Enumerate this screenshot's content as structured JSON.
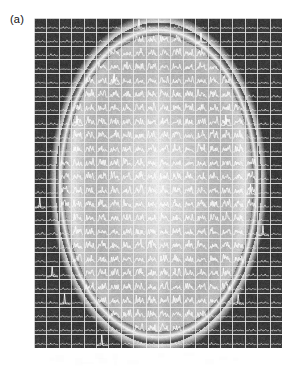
{
  "figure": {
    "panel_label": "(a)",
    "type": "mrsi-spectroscopic-imaging-overlay",
    "modality": "MR Spectroscopic Imaging (MRSI) grid overlaid on axial brain MRI",
    "colors": {
      "page_background": "#ffffff",
      "label_text": "#111111",
      "image_background_dark": "#3a3a3a",
      "skull_ring_bright": "#f2f2f2",
      "brain_interior": "#b9b9b9",
      "grid_line": "#e8e8e8",
      "spectrum_trace": "#fdfdfd",
      "footer_mark": "#f1f1f1"
    },
    "image_region": {
      "left_px": 34,
      "top_px": 18,
      "width_px": 248,
      "height_px": 330
    },
    "grid": {
      "columns": 20,
      "rows": 24,
      "cell_width_px": 12.4,
      "cell_height_px": 13.75,
      "line_width_px": 1,
      "visible": true
    },
    "brain": {
      "shape": "ellipse",
      "center_x_frac": 0.5,
      "center_y_frac": 0.5,
      "radius_x_frac": 0.395,
      "radius_y_frac": 0.465,
      "skull_ring_thickness_frac": 0.035,
      "interior_brightness": 0.72,
      "exterior_brightness": 0.23
    },
    "spectra": {
      "description": "Each voxel cell holds a small 1D NMR spectrum trace; amplitude and peak count are higher inside the brain parenchyma and minimal outside the skull.",
      "trace_color": "#fdfdfd",
      "baseline_frac": 0.78,
      "peak_count_inside": 5,
      "peak_count_outside": 2,
      "max_amplitude_inside_frac": 0.62,
      "max_amplitude_outside_frac": 0.16
    },
    "footer_marks": {
      "present": true,
      "count": 14,
      "opacity": 0.06,
      "description": "very faint light-gray residual marks beneath the image block"
    }
  },
  "chart_data": {
    "type": "heatmap",
    "title": "(a)",
    "xlabel": "",
    "ylabel": "",
    "grid": true,
    "legend": "none",
    "nx": 20,
    "ny": 24,
    "value_label": "MRI signal intensity (0-1)",
    "zlim": [
      0,
      1
    ],
    "row_intensity_profiles": [
      [
        0.22,
        0.22,
        0.23,
        0.23,
        0.24,
        0.26,
        0.3,
        0.36,
        0.42,
        0.46,
        0.46,
        0.42,
        0.36,
        0.3,
        0.26,
        0.24,
        0.23,
        0.23,
        0.22,
        0.22
      ],
      [
        0.22,
        0.23,
        0.23,
        0.24,
        0.28,
        0.4,
        0.62,
        0.8,
        0.9,
        0.93,
        0.93,
        0.9,
        0.8,
        0.62,
        0.4,
        0.28,
        0.24,
        0.23,
        0.23,
        0.22
      ],
      [
        0.23,
        0.23,
        0.24,
        0.3,
        0.52,
        0.82,
        0.92,
        0.8,
        0.74,
        0.72,
        0.72,
        0.74,
        0.8,
        0.92,
        0.82,
        0.52,
        0.3,
        0.24,
        0.23,
        0.23
      ],
      [
        0.23,
        0.24,
        0.28,
        0.46,
        0.8,
        0.9,
        0.74,
        0.7,
        0.7,
        0.7,
        0.7,
        0.7,
        0.7,
        0.74,
        0.9,
        0.8,
        0.46,
        0.28,
        0.24,
        0.23
      ],
      [
        0.24,
        0.25,
        0.34,
        0.66,
        0.88,
        0.76,
        0.7,
        0.7,
        0.71,
        0.72,
        0.72,
        0.71,
        0.7,
        0.7,
        0.76,
        0.88,
        0.66,
        0.34,
        0.25,
        0.24
      ],
      [
        0.24,
        0.26,
        0.42,
        0.8,
        0.82,
        0.71,
        0.7,
        0.71,
        0.73,
        0.75,
        0.75,
        0.73,
        0.71,
        0.7,
        0.71,
        0.82,
        0.8,
        0.42,
        0.26,
        0.24
      ],
      [
        0.25,
        0.28,
        0.52,
        0.86,
        0.76,
        0.7,
        0.71,
        0.73,
        0.76,
        0.78,
        0.78,
        0.76,
        0.73,
        0.71,
        0.7,
        0.76,
        0.86,
        0.52,
        0.28,
        0.25
      ],
      [
        0.25,
        0.3,
        0.58,
        0.88,
        0.73,
        0.7,
        0.72,
        0.75,
        0.78,
        0.8,
        0.8,
        0.78,
        0.75,
        0.72,
        0.7,
        0.73,
        0.88,
        0.58,
        0.3,
        0.25
      ],
      [
        0.26,
        0.31,
        0.6,
        0.88,
        0.72,
        0.7,
        0.73,
        0.77,
        0.8,
        0.82,
        0.82,
        0.8,
        0.77,
        0.73,
        0.7,
        0.72,
        0.88,
        0.6,
        0.31,
        0.26
      ],
      [
        0.26,
        0.32,
        0.62,
        0.88,
        0.72,
        0.71,
        0.74,
        0.78,
        0.82,
        0.84,
        0.84,
        0.82,
        0.78,
        0.74,
        0.71,
        0.72,
        0.88,
        0.62,
        0.32,
        0.26
      ],
      [
        0.26,
        0.32,
        0.62,
        0.88,
        0.72,
        0.71,
        0.75,
        0.79,
        0.83,
        0.85,
        0.85,
        0.83,
        0.79,
        0.75,
        0.71,
        0.72,
        0.88,
        0.62,
        0.32,
        0.26
      ],
      [
        0.26,
        0.32,
        0.62,
        0.88,
        0.72,
        0.71,
        0.75,
        0.8,
        0.84,
        0.86,
        0.86,
        0.84,
        0.8,
        0.75,
        0.71,
        0.72,
        0.88,
        0.62,
        0.32,
        0.26
      ],
      [
        0.26,
        0.32,
        0.62,
        0.88,
        0.72,
        0.71,
        0.75,
        0.8,
        0.84,
        0.86,
        0.86,
        0.84,
        0.8,
        0.75,
        0.71,
        0.72,
        0.88,
        0.62,
        0.32,
        0.26
      ],
      [
        0.26,
        0.32,
        0.62,
        0.88,
        0.72,
        0.71,
        0.75,
        0.79,
        0.83,
        0.85,
        0.85,
        0.83,
        0.79,
        0.75,
        0.71,
        0.72,
        0.88,
        0.62,
        0.32,
        0.26
      ],
      [
        0.26,
        0.32,
        0.62,
        0.88,
        0.72,
        0.71,
        0.74,
        0.78,
        0.82,
        0.84,
        0.84,
        0.82,
        0.78,
        0.74,
        0.71,
        0.72,
        0.88,
        0.62,
        0.32,
        0.26
      ],
      [
        0.26,
        0.31,
        0.6,
        0.88,
        0.72,
        0.7,
        0.73,
        0.77,
        0.8,
        0.82,
        0.82,
        0.8,
        0.77,
        0.73,
        0.7,
        0.72,
        0.88,
        0.6,
        0.31,
        0.26
      ],
      [
        0.25,
        0.3,
        0.58,
        0.88,
        0.73,
        0.7,
        0.72,
        0.75,
        0.78,
        0.8,
        0.8,
        0.78,
        0.75,
        0.72,
        0.7,
        0.73,
        0.88,
        0.58,
        0.3,
        0.25
      ],
      [
        0.25,
        0.28,
        0.52,
        0.86,
        0.76,
        0.7,
        0.71,
        0.73,
        0.76,
        0.78,
        0.78,
        0.76,
        0.73,
        0.71,
        0.7,
        0.76,
        0.86,
        0.52,
        0.28,
        0.25
      ],
      [
        0.24,
        0.26,
        0.42,
        0.8,
        0.82,
        0.71,
        0.7,
        0.71,
        0.73,
        0.75,
        0.75,
        0.73,
        0.71,
        0.7,
        0.71,
        0.82,
        0.8,
        0.42,
        0.26,
        0.24
      ],
      [
        0.24,
        0.25,
        0.34,
        0.66,
        0.88,
        0.76,
        0.7,
        0.7,
        0.71,
        0.72,
        0.72,
        0.71,
        0.7,
        0.7,
        0.76,
        0.88,
        0.66,
        0.34,
        0.25,
        0.24
      ],
      [
        0.23,
        0.24,
        0.28,
        0.46,
        0.8,
        0.9,
        0.74,
        0.7,
        0.7,
        0.7,
        0.7,
        0.7,
        0.7,
        0.74,
        0.9,
        0.8,
        0.46,
        0.28,
        0.24,
        0.23
      ],
      [
        0.23,
        0.23,
        0.24,
        0.3,
        0.52,
        0.82,
        0.92,
        0.8,
        0.74,
        0.72,
        0.72,
        0.74,
        0.8,
        0.92,
        0.82,
        0.52,
        0.3,
        0.24,
        0.23,
        0.23
      ],
      [
        0.22,
        0.23,
        0.23,
        0.24,
        0.28,
        0.4,
        0.62,
        0.8,
        0.9,
        0.93,
        0.93,
        0.9,
        0.8,
        0.62,
        0.4,
        0.28,
        0.24,
        0.23,
        0.23,
        0.22
      ],
      [
        0.22,
        0.22,
        0.23,
        0.23,
        0.24,
        0.26,
        0.3,
        0.36,
        0.42,
        0.46,
        0.46,
        0.42,
        0.36,
        0.3,
        0.26,
        0.24,
        0.23,
        0.23,
        0.22,
        0.22
      ]
    ]
  }
}
